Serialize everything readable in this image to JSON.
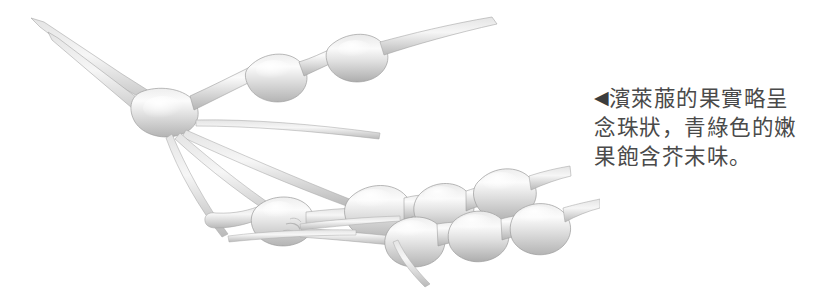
{
  "page": {
    "background_color": "#ffffff",
    "width": 827,
    "height": 289
  },
  "figure": {
    "name": "beaded-seed-pod-photo",
    "rendering": "grayscale desaturated photograph on white background",
    "colors": {
      "pod_light": "#f2f2f2",
      "pod_mid": "#d9d9d9",
      "pod_shadow": "#b0b0b0",
      "pod_outline": "#9a9a9a",
      "stem": "#c8c8c8"
    }
  },
  "caption": {
    "marker": "◀",
    "marker_icon_name": "left-pointing-triangle-icon",
    "lines": [
      "濱萊菔的果實略呈",
      "念珠狀，青綠色的嫩",
      "果飽含芥末味。"
    ],
    "full_text": "◀濱萊菔的果實略呈念珠狀，青綠色的嫩果飽含芥末味。",
    "text_color": "#4a4a4a"
  }
}
